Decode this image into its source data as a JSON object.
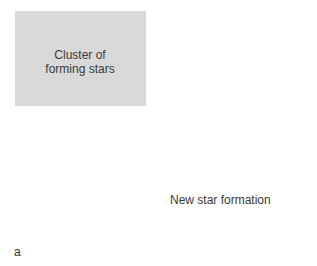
{
  "figure": {
    "panel_letter": "a",
    "labels": {
      "cluster": [
        "Cluster of",
        "forming stars"
      ],
      "new_formation": "New star formation"
    },
    "colors": {
      "background": "#d9d9d9",
      "frame": "#6f6f6f",
      "cloud_light": "#e2e2e2",
      "cloud_dark": "#7f7f7f",
      "bubble": "#ececec",
      "star_fill": "#8c8c8c",
      "arrows": "#1f1f1f",
      "text": "#3a3a3a"
    }
  }
}
